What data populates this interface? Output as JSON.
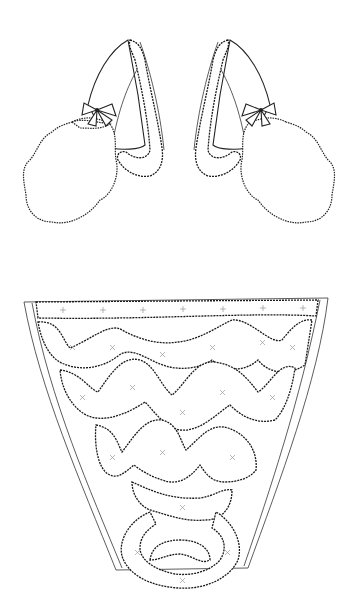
{
  "illustration": {
    "subject": "lace stomacher and pair of sleeve ruffles with bows",
    "background": "#ffffff",
    "line_color": "#222222",
    "parts": [
      {
        "name": "left-sleeve-ruffle",
        "position": "top-left"
      },
      {
        "name": "right-sleeve-ruffle",
        "position": "top-right"
      },
      {
        "name": "stomacher",
        "position": "bottom-center"
      }
    ]
  }
}
